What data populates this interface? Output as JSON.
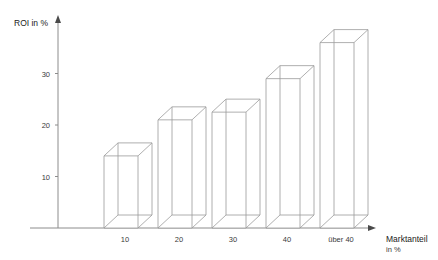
{
  "chart_data": {
    "type": "bar",
    "title": "",
    "subtitle": "",
    "style": "3d-wireframe",
    "xlabel": "Marktanteil",
    "xlabel_unit": "in %",
    "ylabel": "ROI in %",
    "categories": [
      "10",
      "20",
      "30",
      "40",
      "über 40"
    ],
    "values": [
      14,
      21,
      22.5,
      29,
      36
    ],
    "series": [
      {
        "name": "ROI",
        "values": [
          14,
          21,
          22.5,
          29,
          36
        ]
      }
    ],
    "ytick_labels": [
      "10",
      "20",
      "30"
    ],
    "ytick_values": [
      10,
      20,
      30
    ],
    "ylim": [
      0,
      40
    ],
    "xtick_labels": [
      "10",
      "20",
      "30",
      "40",
      "über 40"
    ],
    "grid": false,
    "legend": false,
    "legend_position": "none",
    "axis_arrows": true,
    "annotations": []
  },
  "colors": {
    "background": "#ffffff",
    "line": "#9a9a9a",
    "axis": "#8c8c8c",
    "text": "#1a1a1a",
    "tick_text": "#3a3a3a",
    "bar_face": "#ffffff"
  },
  "geometry": {
    "baseline_y": 228,
    "axis_x": 58,
    "unit_px_per_percent": 5.15,
    "depth_dx": 14,
    "depth_dy": 13,
    "bar_width": 34,
    "bar_left_x": [
      104,
      158,
      212,
      266,
      320
    ]
  },
  "axis_labels": {
    "y_axis_title": "ROI in %",
    "x_axis_title_line1": "Marktanteil",
    "x_axis_title_line2": "in %"
  }
}
